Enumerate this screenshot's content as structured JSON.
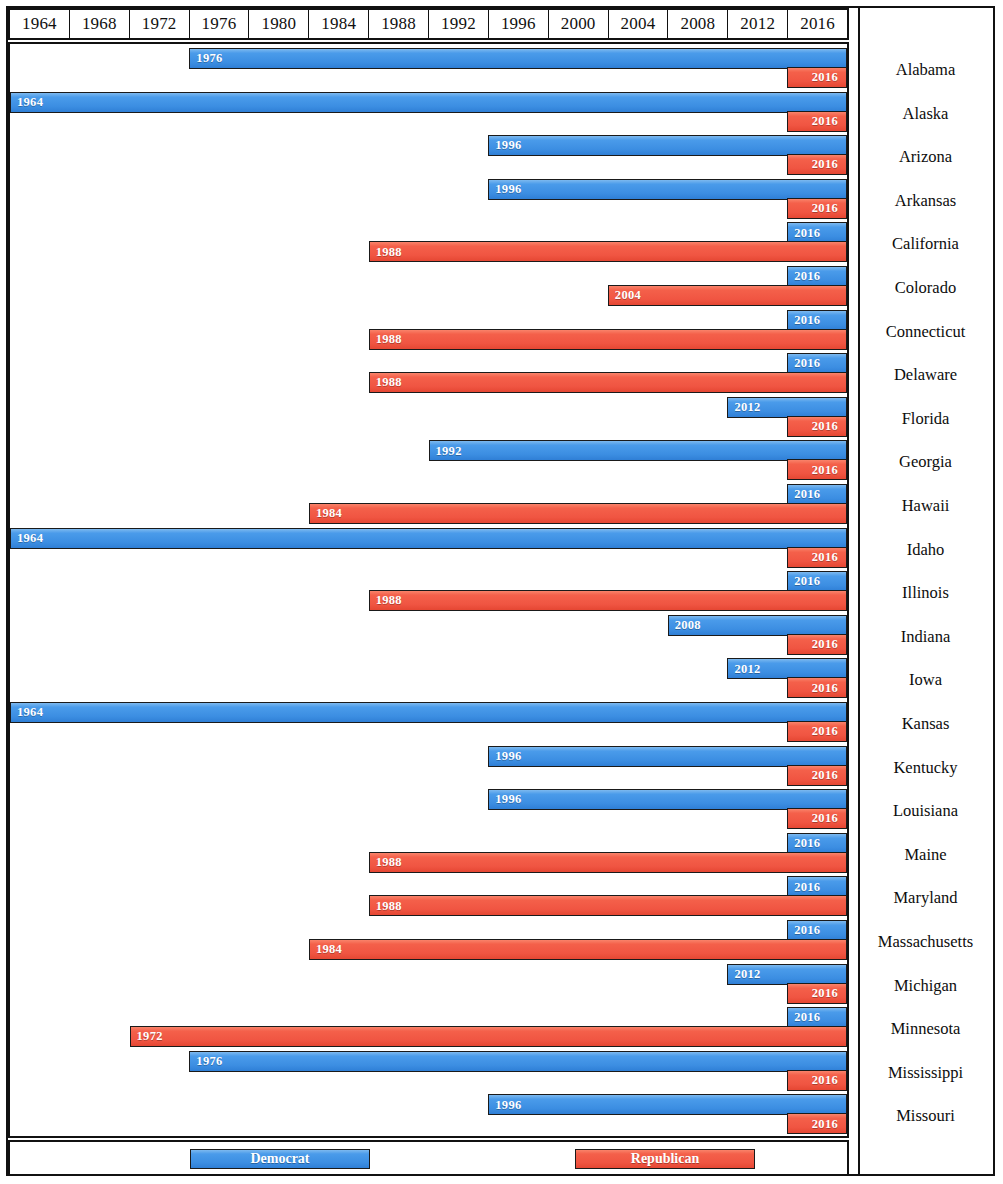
{
  "axis": {
    "ticks": [
      "1964",
      "1968",
      "1972",
      "1976",
      "1980",
      "1984",
      "1988",
      "1992",
      "1996",
      "2000",
      "2004",
      "2008",
      "2012",
      "2016"
    ],
    "start_year": 1964,
    "end_year": 2020,
    "step": 4
  },
  "legend": {
    "democrat_label": "Democrat",
    "republican_label": "Republican"
  },
  "colors": {
    "democrat": "#3c8ee2",
    "republican": "#f05542",
    "border": "#1a1a1a",
    "frame": "#111111",
    "background": "#ffffff",
    "text": "#0d0d0d"
  },
  "chart_data": {
    "type": "bar",
    "orientation": "horizontal",
    "subtype": "gantt-range",
    "title": "",
    "xlabel": "",
    "ylabel": "",
    "xlim": [
      1964,
      2020
    ],
    "grid": true,
    "legend_position": "bottom",
    "categories": [
      "Alabama",
      "Alaska",
      "Arizona",
      "Arkansas",
      "California",
      "Colorado",
      "Connecticut",
      "Delaware",
      "Florida",
      "Georgia",
      "Hawaii",
      "Idaho",
      "Illinois",
      "Indiana",
      "Iowa",
      "Kansas",
      "Kentucky",
      "Louisiana",
      "Maine",
      "Maryland",
      "Massachusetts",
      "Michigan",
      "Minnesota",
      "Mississippi",
      "Missouri"
    ],
    "series": [
      {
        "name": "Democrat",
        "color": "#3c8ee2",
        "starts": [
          1976,
          1964,
          1996,
          1996,
          2016,
          2016,
          2016,
          2016,
          2012,
          1992,
          2016,
          1964,
          2016,
          2008,
          2012,
          1964,
          1996,
          1996,
          2016,
          2016,
          2016,
          2012,
          2016,
          1976,
          1996
        ],
        "end": 2020
      },
      {
        "name": "Republican",
        "color": "#f05542",
        "starts": [
          2016,
          2016,
          2016,
          2016,
          1988,
          2004,
          1988,
          1988,
          2016,
          2016,
          1984,
          2016,
          1988,
          2016,
          2016,
          2016,
          2016,
          2016,
          1988,
          1988,
          1984,
          2016,
          1972,
          2016,
          2016
        ],
        "end": 2020
      }
    ],
    "rows": [
      {
        "state": "Alabama",
        "democrat_start": "1976",
        "republican_start": "2016"
      },
      {
        "state": "Alaska",
        "democrat_start": "1964",
        "republican_start": "2016"
      },
      {
        "state": "Arizona",
        "democrat_start": "1996",
        "republican_start": "2016"
      },
      {
        "state": "Arkansas",
        "democrat_start": "1996",
        "republican_start": "2016"
      },
      {
        "state": "California",
        "democrat_start": "2016",
        "republican_start": "1988"
      },
      {
        "state": "Colorado",
        "democrat_start": "2016",
        "republican_start": "2004"
      },
      {
        "state": "Connecticut",
        "democrat_start": "2016",
        "republican_start": "1988"
      },
      {
        "state": "Delaware",
        "democrat_start": "2016",
        "republican_start": "1988"
      },
      {
        "state": "Florida",
        "democrat_start": "2012",
        "republican_start": "2016"
      },
      {
        "state": "Georgia",
        "democrat_start": "1992",
        "republican_start": "2016"
      },
      {
        "state": "Hawaii",
        "democrat_start": "2016",
        "republican_start": "1984"
      },
      {
        "state": "Idaho",
        "democrat_start": "1964",
        "republican_start": "2016"
      },
      {
        "state": "Illinois",
        "democrat_start": "2016",
        "republican_start": "1988"
      },
      {
        "state": "Indiana",
        "democrat_start": "2008",
        "republican_start": "2016"
      },
      {
        "state": "Iowa",
        "democrat_start": "2012",
        "republican_start": "2016"
      },
      {
        "state": "Kansas",
        "democrat_start": "1964",
        "republican_start": "2016"
      },
      {
        "state": "Kentucky",
        "democrat_start": "1996",
        "republican_start": "2016"
      },
      {
        "state": "Louisiana",
        "democrat_start": "1996",
        "republican_start": "2016"
      },
      {
        "state": "Maine",
        "democrat_start": "2016",
        "republican_start": "1988"
      },
      {
        "state": "Maryland",
        "democrat_start": "2016",
        "republican_start": "1988"
      },
      {
        "state": "Massachusetts",
        "democrat_start": "2016",
        "republican_start": "1984"
      },
      {
        "state": "Michigan",
        "democrat_start": "2012",
        "republican_start": "2016"
      },
      {
        "state": "Minnesota",
        "democrat_start": "2016",
        "republican_start": "1972"
      },
      {
        "state": "Mississippi",
        "democrat_start": "1976",
        "republican_start": "2016"
      },
      {
        "state": "Missouri",
        "democrat_start": "1996",
        "republican_start": "2016"
      }
    ]
  }
}
